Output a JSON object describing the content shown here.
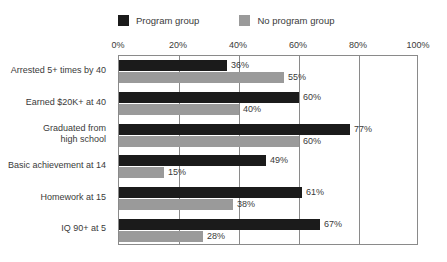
{
  "legend": {
    "entries": [
      {
        "label": "Program group",
        "color": "#1b1b1b",
        "icon": "legend-swatch-dark"
      },
      {
        "label": "No program group",
        "color": "#9a9a9a",
        "icon": "legend-swatch-gray"
      }
    ]
  },
  "axis": {
    "ticks": [
      "0%",
      "20%",
      "40%",
      "60%",
      "80%",
      "100%"
    ]
  },
  "chart_data": {
    "type": "bar",
    "orientation": "horizontal",
    "title": "",
    "xlabel": "",
    "ylabel": "",
    "xlim": [
      0,
      100
    ],
    "xticks": [
      0,
      20,
      40,
      60,
      80,
      100
    ],
    "grid": true,
    "legend_position": "top",
    "categories": [
      "Arrested 5+ times by 40",
      "Earned $20K+ at 40",
      "Graduated from\nhigh school",
      "Basic achievement at 14",
      "Homework at 15",
      "IQ 90+ at 5"
    ],
    "series": [
      {
        "name": "Program group",
        "color": "#1b1b1b",
        "values": [
          36,
          60,
          77,
          49,
          61,
          67
        ],
        "labels": [
          "36%",
          "60%",
          "77%",
          "49%",
          "61%",
          "67%"
        ]
      },
      {
        "name": "No program group",
        "color": "#9a9a9a",
        "values": [
          55,
          40,
          60,
          15,
          38,
          28
        ],
        "labels": [
          "55%",
          "40%",
          "60%",
          "15%",
          "38%",
          "28%"
        ]
      }
    ]
  }
}
